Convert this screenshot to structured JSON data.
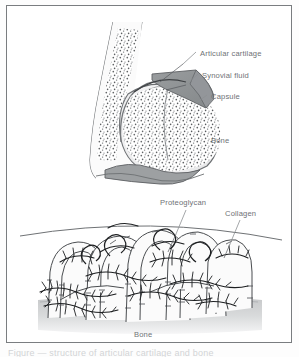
{
  "figure": {
    "frame_border_color": "#7a7d80",
    "background_color": "#ffffff",
    "ink_color": "#4a4d50",
    "label_color": "#6f7276",
    "tissue_gray": "#8f9294",
    "bone_base_gray": "#c9cbcc"
  },
  "caption": {
    "clipped_text": "Figure — structure of articular cartilage and bone"
  },
  "top_panel": {
    "name": "synovial-joint-cross-section",
    "labels": {
      "articular_cartilage": "Articular cartilage",
      "synovial_fluid": "Synovial fluid",
      "capsule": "Capsule",
      "bone": "Bone"
    }
  },
  "bottom_panel": {
    "name": "cartilage-matrix-detail",
    "labels": {
      "proteoglycan": "Proteoglycan",
      "collagen": "Collagen",
      "bone": "Bone"
    }
  }
}
